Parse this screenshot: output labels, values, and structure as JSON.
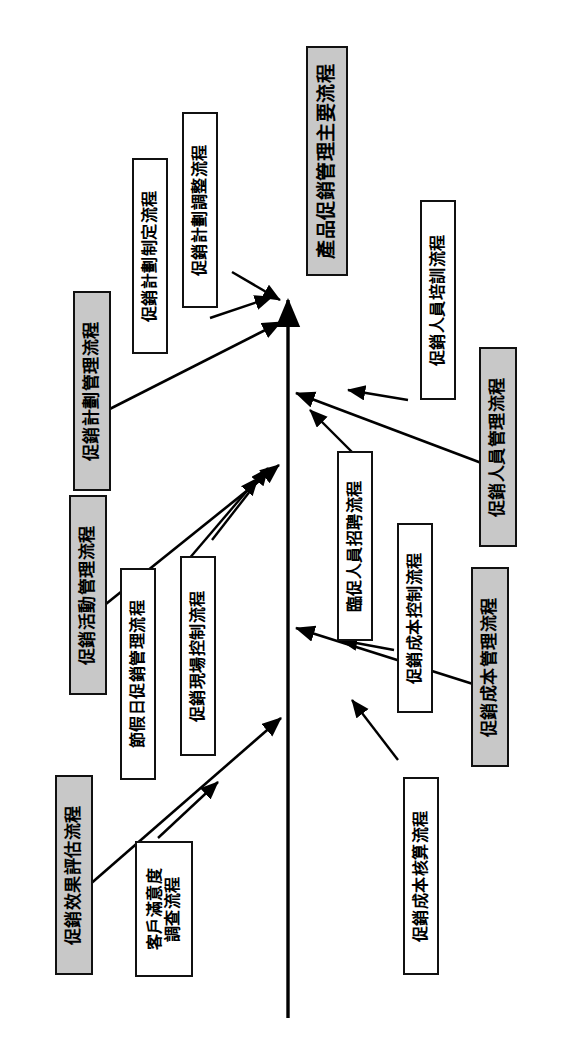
{
  "diagram": {
    "type": "process-flow-fishbone",
    "orientation": "rotated-90-counterclockwise",
    "title": "產品促銷管理主要流程",
    "spine": {
      "name": "main-process-arrow",
      "direction": "upward",
      "color": "#000000"
    },
    "style": {
      "category_fill": "#c8c8c8",
      "subprocess_fill": "#ffffff",
      "border": "#111111",
      "text": "#000000",
      "background": "#ffffff"
    },
    "categories": [
      {
        "id": "cat-plan",
        "label": "促銷計劃管理流程",
        "side": "left"
      },
      {
        "id": "cat-activity",
        "label": "促銷活動管理流程",
        "side": "left"
      },
      {
        "id": "cat-effect",
        "label": "促銷效果評估流程",
        "side": "left"
      },
      {
        "id": "cat-staff",
        "label": "促銷人員管理流程",
        "side": "right"
      },
      {
        "id": "cat-cost",
        "label": "促銷成本管理流程",
        "side": "right"
      }
    ],
    "subprocesses": [
      {
        "id": "sub-plan-make",
        "label": "促銷計劃制定流程",
        "parent": "cat-plan"
      },
      {
        "id": "sub-plan-adjust",
        "label": "促銷計劃調整流程",
        "parent": "cat-plan"
      },
      {
        "id": "sub-holiday",
        "label": "節假日促銷管理流程",
        "parent": "cat-activity"
      },
      {
        "id": "sub-onsite",
        "label": "促銷現場控制流程",
        "parent": "cat-activity"
      },
      {
        "id": "sub-satisfaction",
        "label": "客戶滿意度調查流程",
        "line1": "客戶滿意度",
        "line2": "調查流程",
        "parent": "cat-effect"
      },
      {
        "id": "sub-training",
        "label": "促銷人員培訓流程",
        "parent": "cat-staff"
      },
      {
        "id": "sub-recruit",
        "label": "臨促人員招聘流程",
        "parent": "cat-staff"
      },
      {
        "id": "sub-cost-control",
        "label": "促銷成本控制流程",
        "parent": "cat-cost"
      },
      {
        "id": "sub-cost-account",
        "label": "促銷成本核算流程",
        "parent": "cat-cost"
      }
    ]
  }
}
